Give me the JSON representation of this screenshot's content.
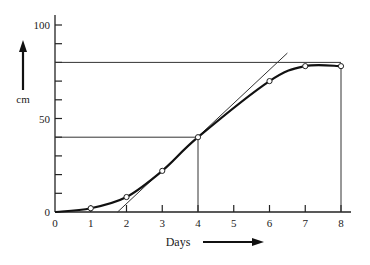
{
  "chart_data": {
    "type": "line",
    "title": "",
    "xlabel": "Days",
    "ylabel": "cm",
    "xlim": [
      0,
      8
    ],
    "ylim": [
      0,
      100
    ],
    "x_ticks": [
      0,
      1,
      2,
      3,
      4,
      5,
      6,
      7,
      8
    ],
    "y_tick_labels": [
      0,
      50,
      100
    ],
    "y_minor_ticks": [
      10,
      20,
      30,
      40,
      60,
      70,
      80,
      90
    ],
    "grid": false,
    "series": [
      {
        "name": "growth curve",
        "x": [
          0,
          1,
          2,
          3,
          4,
          6,
          7,
          8
        ],
        "values": [
          0,
          2,
          8,
          22,
          40,
          70,
          78,
          78
        ],
        "markers": "open-circle"
      }
    ],
    "annotations": {
      "horizontal_lines": [
        {
          "y": 80,
          "x_from": 0,
          "x_to": 8
        },
        {
          "y": 40,
          "x_from": 0,
          "x_to": 4
        }
      ],
      "vertical_lines": [
        {
          "x": 4,
          "y_from": 0,
          "y_to": 40
        },
        {
          "x": 8,
          "y_from": 0,
          "y_to": 78
        }
      ],
      "tangent_line": {
        "x1": 1.75,
        "y1": 0,
        "x2": 6.5,
        "y2": 85
      }
    }
  },
  "labels": {
    "y_axis": "cm",
    "x_axis": "Days"
  }
}
